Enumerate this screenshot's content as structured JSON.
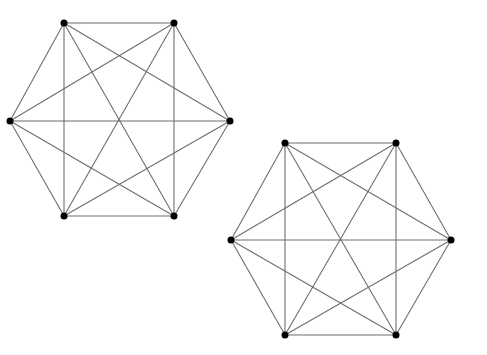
{
  "diagram": {
    "type": "graph-drawings",
    "colors": {
      "edge": "#6e6e6e",
      "vertex": "#000000",
      "background": "#ffffff"
    },
    "vertex_radius": 3.5,
    "graphs": [
      {
        "name": "K6-drawing-1",
        "vertices": [
          {
            "id": "TL",
            "x": 64,
            "y": 23
          },
          {
            "id": "TR",
            "x": 174,
            "y": 23
          },
          {
            "id": "L",
            "x": 10,
            "y": 121
          },
          {
            "id": "R",
            "x": 230,
            "y": 121
          },
          {
            "id": "BL",
            "x": 64,
            "y": 216
          },
          {
            "id": "BR",
            "x": 174,
            "y": 216
          }
        ],
        "edges": [
          [
            "TL",
            "TR"
          ],
          [
            "TR",
            "R"
          ],
          [
            "R",
            "BR"
          ],
          [
            "BR",
            "BL"
          ],
          [
            "BL",
            "L"
          ],
          [
            "L",
            "TL"
          ],
          [
            "TL",
            "BL"
          ],
          [
            "TR",
            "BR"
          ],
          [
            "L",
            "R"
          ],
          [
            "TL",
            "R"
          ],
          [
            "TL",
            "BR"
          ],
          [
            "TR",
            "L"
          ],
          [
            "TR",
            "BL"
          ],
          [
            "L",
            "BR"
          ],
          [
            "R",
            "BL"
          ]
        ]
      },
      {
        "name": "K6-drawing-2",
        "vertices": [
          {
            "id": "TL",
            "x": 285,
            "y": 143
          },
          {
            "id": "TR",
            "x": 396,
            "y": 143
          },
          {
            "id": "L",
            "x": 231,
            "y": 240
          },
          {
            "id": "R",
            "x": 451,
            "y": 240
          },
          {
            "id": "BL",
            "x": 285,
            "y": 335
          },
          {
            "id": "BR",
            "x": 396,
            "y": 335
          }
        ],
        "edges": [
          [
            "TL",
            "TR"
          ],
          [
            "TR",
            "R"
          ],
          [
            "R",
            "BR"
          ],
          [
            "BR",
            "BL"
          ],
          [
            "BL",
            "L"
          ],
          [
            "L",
            "TL"
          ],
          [
            "TL",
            "BL"
          ],
          [
            "TR",
            "BR"
          ],
          [
            "L",
            "R"
          ],
          [
            "TL",
            "R"
          ],
          [
            "TL",
            "BR"
          ],
          [
            "TR",
            "L"
          ],
          [
            "TR",
            "BL"
          ],
          [
            "L",
            "BR"
          ],
          [
            "R",
            "BL"
          ]
        ]
      }
    ]
  }
}
